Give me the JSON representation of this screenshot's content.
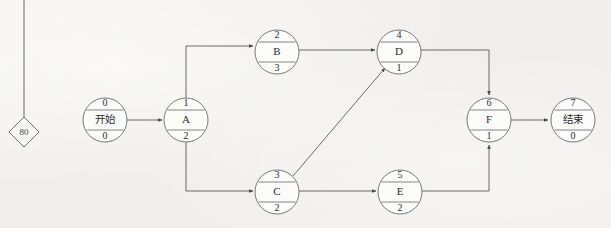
{
  "diagram": {
    "type": "activity-on-node-network",
    "colors": {
      "background": "#f3f2f0",
      "node_fill": "#fbfbfa",
      "stroke": "#6b6b6b",
      "text": "#2c2c2c"
    },
    "nodes": [
      {
        "id": "start",
        "top": "0",
        "name": "开始",
        "bottom": "0",
        "cx": 105,
        "cy": 120,
        "r": 22,
        "cn": true
      },
      {
        "id": "a",
        "top": "1",
        "name": "A",
        "bottom": "2",
        "cx": 186,
        "cy": 120,
        "r": 22,
        "cn": false
      },
      {
        "id": "b",
        "top": "2",
        "name": "B",
        "bottom": "3",
        "cx": 277,
        "cy": 52,
        "r": 22,
        "cn": false
      },
      {
        "id": "c",
        "top": "3",
        "name": "C",
        "bottom": "2",
        "cx": 277,
        "cy": 192,
        "r": 22,
        "cn": false
      },
      {
        "id": "d",
        "top": "4",
        "name": "D",
        "bottom": "1",
        "cx": 399,
        "cy": 52,
        "r": 22,
        "cn": false
      },
      {
        "id": "e",
        "top": "5",
        "name": "E",
        "bottom": "2",
        "cx": 400,
        "cy": 192,
        "r": 22,
        "cn": false
      },
      {
        "id": "f",
        "top": "6",
        "name": "F",
        "bottom": "1",
        "cx": 489,
        "cy": 120,
        "r": 22,
        "cn": false
      },
      {
        "id": "end",
        "top": "7",
        "name": "结束",
        "bottom": "0",
        "cx": 573,
        "cy": 120,
        "r": 22,
        "cn": true
      }
    ],
    "edges": [
      {
        "id": "start-a",
        "from": "start",
        "to": "a"
      },
      {
        "id": "a-b",
        "from": "a",
        "to": "b"
      },
      {
        "id": "a-c",
        "from": "a",
        "to": "c"
      },
      {
        "id": "b-d",
        "from": "b",
        "to": "d"
      },
      {
        "id": "c-d",
        "from": "c",
        "to": "d"
      },
      {
        "id": "c-e",
        "from": "c",
        "to": "e"
      },
      {
        "id": "d-f",
        "from": "d",
        "to": "f"
      },
      {
        "id": "e-f",
        "from": "e",
        "to": "f"
      },
      {
        "id": "f-end",
        "from": "f",
        "to": "end"
      }
    ],
    "marker": {
      "label": "80",
      "cx": 24,
      "cy": 132,
      "half": 15,
      "leader_line_top_y": 0
    }
  }
}
